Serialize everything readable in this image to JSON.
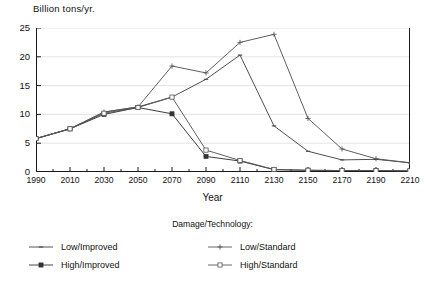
{
  "chart_data": {
    "type": "line",
    "title": "",
    "xlabel": "Year",
    "ylabel": "Billion tons/yr.",
    "legend_title": "Damage/Technology:",
    "legend_position": "bottom",
    "grid": true,
    "xlim": [
      1990,
      2210
    ],
    "ylim": [
      0,
      25
    ],
    "yticks": [
      0,
      5,
      10,
      15,
      20,
      25
    ],
    "x": [
      1990,
      2010,
      2030,
      2050,
      2070,
      2090,
      2110,
      2130,
      2150,
      2170,
      2190,
      2210
    ],
    "xticklabels": [
      "1990",
      "2010",
      "2030",
      "2050",
      "2070",
      "2090",
      "2110",
      "2130",
      "2150",
      "2170",
      "2190",
      "2210"
    ],
    "series": [
      {
        "name": "Low/Improved",
        "marker": "dash",
        "color": "#444444",
        "values": [
          5.8,
          7.5,
          10.4,
          11.3,
          13.0,
          16.1,
          20.3,
          8.0,
          3.6,
          2.1,
          2.2,
          1.6
        ]
      },
      {
        "name": "High/Improved",
        "marker": "filled-square",
        "color": "#333333",
        "values": [
          5.8,
          7.5,
          10.0,
          11.2,
          10.1,
          2.7,
          1.9,
          0.4,
          0.3,
          0.25,
          0.25,
          0.2
        ]
      },
      {
        "name": "Low/Standard",
        "marker": "plus",
        "color": "#555555",
        "values": [
          5.8,
          7.5,
          10.4,
          11.3,
          18.4,
          17.2,
          22.5,
          23.9,
          9.3,
          4.0,
          2.3,
          1.6
        ]
      },
      {
        "name": "High/Standard",
        "marker": "open-square",
        "color": "#555555",
        "values": [
          5.8,
          7.5,
          10.2,
          11.2,
          13.0,
          3.8,
          2.0,
          0.45,
          0.3,
          0.25,
          0.25,
          0.2
        ]
      }
    ]
  },
  "axes": {
    "y_title": "Billion tons/yr.",
    "x_title": "Year"
  },
  "legend": {
    "title": "Damage/Technology:",
    "entries": [
      {
        "label": "Low/Improved",
        "marker": "dash"
      },
      {
        "label": "High/Improved",
        "marker": "filled-square"
      },
      {
        "label": "Low/Standard",
        "marker": "plus"
      },
      {
        "label": "High/Standard",
        "marker": "open-square"
      }
    ]
  }
}
